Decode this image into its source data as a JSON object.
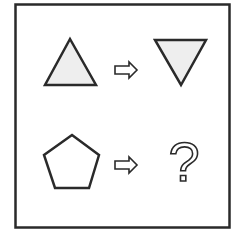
{
  "puzzle": {
    "description": "Shape analogy puzzle",
    "row1": {
      "from": "triangle-up",
      "arrow": "right-arrow",
      "to": "triangle-down"
    },
    "row2": {
      "from": "pentagon",
      "arrow": "right-arrow",
      "to": "question-mark"
    },
    "question_mark": "?",
    "colors": {
      "stroke": "#2a2a2a",
      "fill_shape": "#eeeeee",
      "background": "#ffffff"
    }
  }
}
